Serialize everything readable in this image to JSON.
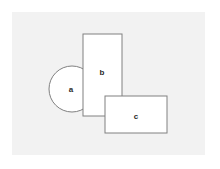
{
  "figure": {
    "background_color": "#ffffff",
    "panel_color": "#f2f2f2",
    "shape_fill": "#ffffff",
    "stroke_color": "#808080",
    "label_color": "#2b2b2b",
    "stroke_width": 1
  },
  "panel": {
    "x": 12,
    "y": 12,
    "width": 193,
    "height": 143
  },
  "shapes": [
    {
      "id": "a",
      "label": "a",
      "type": "circle",
      "cx": 72,
      "cy": 89,
      "r": 23,
      "label_x": 71,
      "label_y": 90,
      "z": 1
    },
    {
      "id": "b",
      "label": "b",
      "type": "rectangle",
      "x": 83,
      "y": 34,
      "width": 39,
      "height": 82,
      "label_x": 102,
      "label_y": 73,
      "z": 2
    },
    {
      "id": "c",
      "label": "c",
      "type": "rectangle",
      "x": 105,
      "y": 96,
      "width": 62,
      "height": 37,
      "label_x": 136,
      "label_y": 117,
      "z": 3
    }
  ],
  "labels": {
    "a": "a",
    "b": "b",
    "c": "c"
  }
}
